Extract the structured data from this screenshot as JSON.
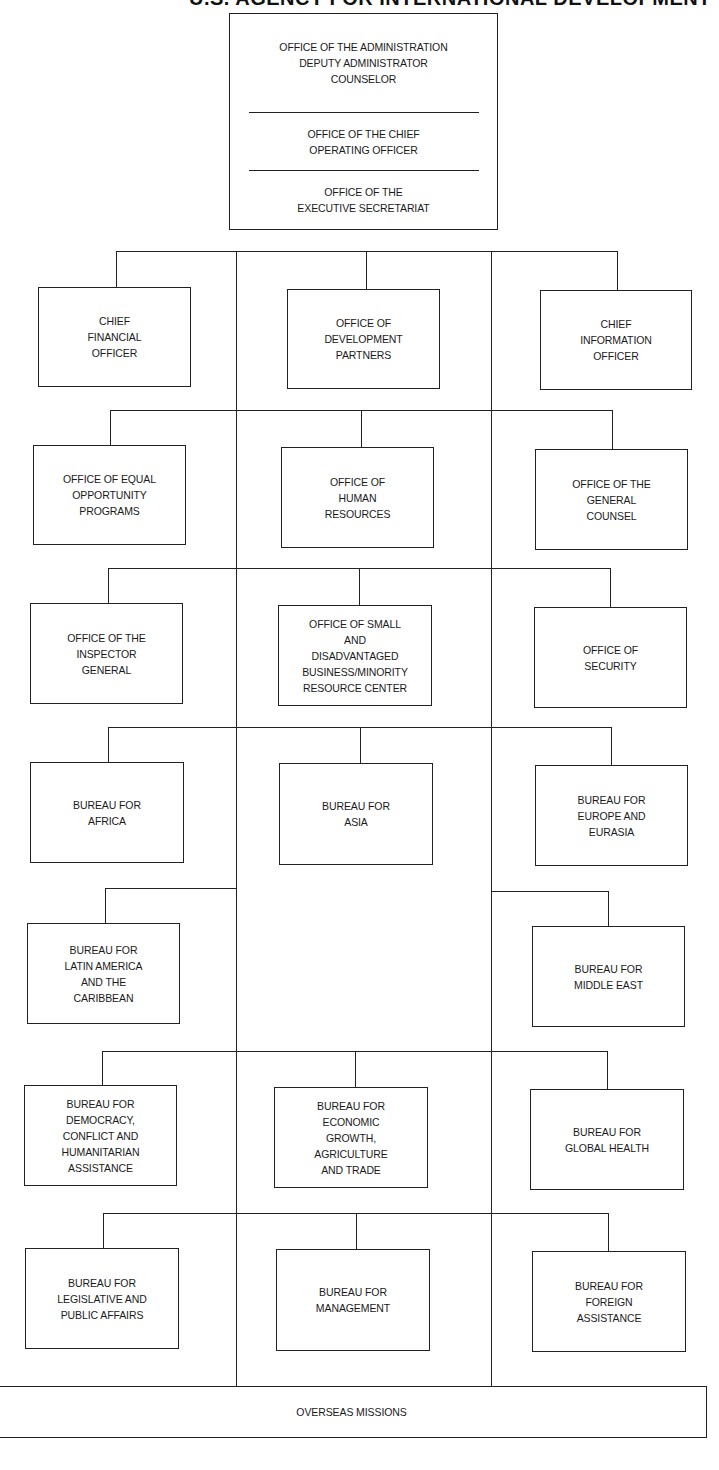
{
  "header": {
    "title": "U.S. AGENCY FOR INTERNATIONAL DEVELOPMENT"
  },
  "top_office": {
    "sections": [
      "OFFICE OF THE ADMINISTRATION\nDEPUTY ADMINISTRATOR\nCOUNSELOR",
      "OFFICE OF THE CHIEF\nOPERATING OFFICER",
      "OFFICE OF THE\nEXECUTIVE SECRETARIAT"
    ]
  },
  "rows": [
    {
      "left": "CHIEF\nFINANCIAL\nOFFICER",
      "center": "OFFICE OF\nDEVELOPMENT\nPARTNERS",
      "right": "CHIEF\nINFORMATION\nOFFICER"
    },
    {
      "left": "OFFICE OF EQUAL\nOPPORTUNITY\nPROGRAMS",
      "center": "OFFICE OF\nHUMAN\nRESOURCES",
      "right": "OFFICE OF THE\nGENERAL\nCOUNSEL"
    },
    {
      "left": "OFFICE OF THE\nINSPECTOR\nGENERAL",
      "center": "OFFICE OF SMALL\nAND\nDISADVANTAGED\nBUSINESS/MINORITY\nRESOURCE CENTER",
      "right": "OFFICE OF\nSECURITY"
    },
    {
      "left": "BUREAU FOR\nAFRICA",
      "center": "BUREAU FOR\nASIA",
      "right": "BUREAU FOR\nEUROPE AND\nEURASIA"
    },
    {
      "left": "BUREAU FOR\nLATIN AMERICA\nAND THE\nCARIBBEAN",
      "right": "BUREAU FOR\nMIDDLE EAST"
    },
    {
      "left": "BUREAU FOR\nDEMOCRACY,\nCONFLICT AND\nHUMANITARIAN\nASSISTANCE",
      "center": "BUREAU FOR\nECONOMIC\nGROWTH,\nAGRICULTURE\nAND TRADE",
      "right": "BUREAU FOR\nGLOBAL HEALTH"
    },
    {
      "left": "BUREAU FOR\nLEGISLATIVE AND\nPUBLIC AFFAIRS",
      "center": "BUREAU FOR\nMANAGEMENT",
      "right": "BUREAU FOR\nFOREIGN\nASSISTANCE"
    }
  ],
  "bottom": {
    "label": "OVERSEAS MISSIONS"
  },
  "colors": {
    "line": "#222222",
    "background": "#ffffff",
    "text": "#1a1a1a"
  }
}
